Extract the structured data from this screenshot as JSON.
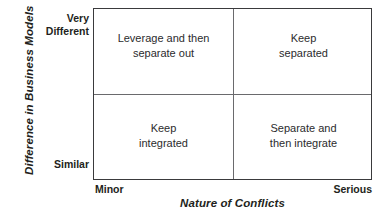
{
  "chart_data": {
    "type": "table",
    "title": "",
    "xlabel": "Nature of Conflicts",
    "ylabel": "Difference in Business Models",
    "x_ticks": [
      "Minor",
      "Serious"
    ],
    "y_ticks": [
      "Very\nDifferent",
      "Similar"
    ],
    "grid": true,
    "legend": "none",
    "categories": [
      "Minor",
      "Serious"
    ],
    "rows": [
      "Very Different",
      "Similar"
    ],
    "cells": [
      {
        "row": "Very Different",
        "column": "Minor",
        "value": "Leverage and then\nseparate out"
      },
      {
        "row": "Very Different",
        "column": "Serious",
        "value": "Keep\nseparated"
      },
      {
        "row": "Similar",
        "column": "Minor",
        "value": "Keep\nintegrated"
      },
      {
        "row": "Similar",
        "column": "Serious",
        "value": "Separate and\nthen integrate"
      }
    ]
  },
  "axes": {
    "y_title": "Difference in Business Models",
    "x_title": "Nature of Conflicts",
    "y_tick_top": "Very\nDifferent",
    "y_tick_bottom": "Similar",
    "x_tick_left": "Minor",
    "x_tick_right": "Serious"
  },
  "quadrants": {
    "top_left": "Leverage and then\nseparate out",
    "top_right": "Keep\nseparated",
    "bottom_left": "Keep\nintegrated",
    "bottom_right": "Separate and\nthen integrate"
  },
  "colors": {
    "border": "#3a3a3c",
    "divider": "#6a6a6d",
    "text": "#231f20",
    "quadrant_text": "#2b2b2d",
    "background": "#ffffff"
  }
}
